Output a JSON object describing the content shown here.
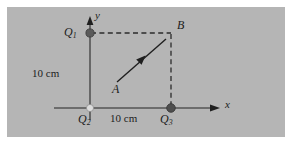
{
  "figure": {
    "type": "physics-diagram",
    "panel_color": "#b5b5b5",
    "page_color": "#ffffff",
    "line_color": "#4a4a4a",
    "ink_color": "#1c1c1c",
    "axes": {
      "x_label": "x",
      "y_label": "y"
    },
    "points": [
      {
        "id": "Q1",
        "label": "Q",
        "subscript": "1",
        "marker": "dark-dot",
        "x_px": 90,
        "y_px": 33
      },
      {
        "id": "Q2",
        "label": "Q",
        "subscript": "2",
        "marker": "light-dot",
        "x_px": 90,
        "y_px": 108
      },
      {
        "id": "Q3",
        "label": "Q",
        "subscript": "3",
        "marker": "dark-dot",
        "x_px": 171,
        "y_px": 108
      },
      {
        "id": "B",
        "label": "B",
        "subscript": "",
        "marker": "none",
        "x_px": 171,
        "y_px": 33
      }
    ],
    "vector": {
      "label": "A",
      "from_px": [
        117,
        82
      ],
      "to_px": [
        167,
        38
      ]
    },
    "dimensions": [
      {
        "id": "vertical-distance",
        "text": "10 cm",
        "orientation": "vertical-segment"
      },
      {
        "id": "horizontal-distance",
        "text": "10 cm",
        "orientation": "horizontal-segment"
      }
    ]
  }
}
